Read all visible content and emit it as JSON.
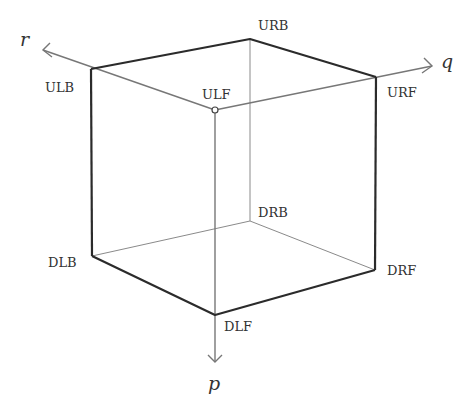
{
  "diagram": {
    "type": "cube-vertex-diagram",
    "axes": [
      {
        "id": "r",
        "label": "r",
        "direction": "up-left"
      },
      {
        "id": "q",
        "label": "q",
        "direction": "right"
      },
      {
        "id": "p",
        "label": "p",
        "direction": "down"
      }
    ],
    "vertices": [
      {
        "id": "ULB",
        "label": "ULB"
      },
      {
        "id": "URB",
        "label": "URB"
      },
      {
        "id": "URF",
        "label": "URF"
      },
      {
        "id": "ULF",
        "label": "ULF"
      },
      {
        "id": "DLB",
        "label": "DLB"
      },
      {
        "id": "DRB",
        "label": "DRB"
      },
      {
        "id": "DRF",
        "label": "DRF"
      },
      {
        "id": "DLF",
        "label": "DLF"
      }
    ],
    "colors": {
      "edge": "#2b2b2b",
      "hidden_edge": "#888888",
      "axis": "#777777"
    }
  }
}
